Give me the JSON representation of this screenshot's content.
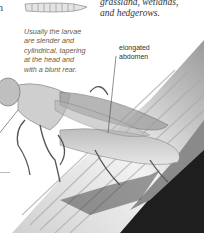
{
  "page": {
    "partial_left_text": "n",
    "habitat_text": "grassland, wetlands, and hedgerows.",
    "habitat_lines": [
      "grassland, wetlands,",
      "and hedgerows."
    ],
    "larva_caption": "Usually the larvae are slender and cylindrical, tapering at the head and with a blunt rear.",
    "larva_caption_lines": [
      "Usually the larvae",
      "are slender and",
      "cylindrical, tapering",
      "at the head and",
      "with a blunt rear."
    ],
    "annotation": {
      "label_lines": [
        "elongated",
        "abdomen"
      ]
    }
  },
  "illustrations": {
    "larva": "larva-drawing",
    "insect": "fly-on-grass-stem-photo"
  },
  "colors": {
    "background": "#ffffff",
    "caption": "#6b5a3c",
    "text": "#333333",
    "stem_light": "#e8e8e8",
    "stem_dark": "#1a1a1a"
  }
}
